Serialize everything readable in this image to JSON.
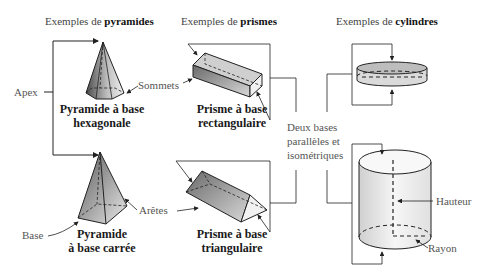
{
  "headers": {
    "pyramides": {
      "prefix": "Exemples de ",
      "bold": "pyramides"
    },
    "prismes": {
      "prefix": "Exemples de ",
      "bold": "prismes"
    },
    "cylindres": {
      "prefix": "Exemples de ",
      "bold": "cylindres"
    }
  },
  "shapes": {
    "pyramide_hex": {
      "line1": "Pyramide à base",
      "line2": "hexagonale"
    },
    "pyramide_carre": {
      "line1": "Pyramide",
      "line2": "à base carrée"
    },
    "prisme_rect": {
      "line1": "Prisme à base",
      "line2": "rectangulaire"
    },
    "prisme_tri": {
      "line1": "Prisme à base",
      "line2": "triangulaire"
    }
  },
  "labels": {
    "apex": "Apex",
    "base": "Base",
    "sommets": "Sommets",
    "aretes": "Arêtes",
    "hauteur": "Hauteur",
    "rayon": "Rayon",
    "deux_bases": {
      "line1": "Deux bases",
      "line2": "parallèles et",
      "line3": "isométriques"
    }
  },
  "colors": {
    "line": "#222222",
    "label_text": "#555555",
    "shape_dark": "#6e6e6e",
    "shape_light": "#f2f2f2"
  }
}
